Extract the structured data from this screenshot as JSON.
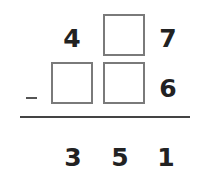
{
  "problem": {
    "operation": "subtraction",
    "minuend": {
      "hundreds": "4",
      "tens": "",
      "ones": "7"
    },
    "subtrahend": {
      "hundreds": "",
      "tens": "",
      "ones": "6"
    },
    "operator_symbol": "−",
    "result": {
      "hundreds": "3",
      "tens": "5",
      "ones": "1"
    }
  },
  "colors": {
    "digit": "#222222",
    "box_border": "#7a7a7a",
    "rule": "#444444"
  }
}
